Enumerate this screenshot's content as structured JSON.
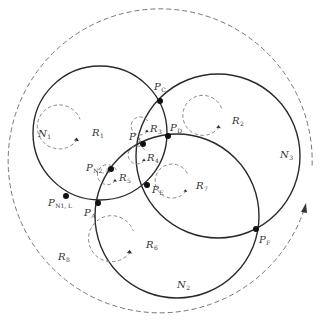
{
  "diagram": {
    "networks": [
      {
        "id": "N1",
        "label": "N",
        "sub": "1",
        "cx": 100,
        "cy": 133,
        "r": 67,
        "label_x": 38,
        "label_y": 137
      },
      {
        "id": "N2",
        "label": "N",
        "sub": "2",
        "cx": 177,
        "cy": 216,
        "r": 82,
        "label_x": 177,
        "label_y": 288
      },
      {
        "id": "N3",
        "label": "N",
        "sub": "3",
        "cx": 218,
        "cy": 156,
        "r": 82,
        "label_x": 280,
        "label_y": 158
      }
    ],
    "outer_region": {
      "cx": 163,
      "cy": 168,
      "r": 152,
      "label": "R",
      "sub": "8",
      "label_x": 58,
      "label_y": 260
    },
    "points": [
      {
        "id": "PA",
        "label": "P",
        "sub": "A",
        "x": 98,
        "y": 203,
        "label_x": 84,
        "label_y": 216
      },
      {
        "id": "PB",
        "label": "P",
        "sub": "B",
        "x": 143,
        "y": 144,
        "label_x": 129,
        "label_y": 140
      },
      {
        "id": "PC",
        "label": "P",
        "sub": "C",
        "x": 160,
        "y": 101,
        "label_x": 154,
        "label_y": 90
      },
      {
        "id": "PD",
        "label": "P",
        "sub": "D",
        "x": 168,
        "y": 136,
        "label_x": 170,
        "label_y": 131
      },
      {
        "id": "PE",
        "label": "P",
        "sub": "E",
        "x": 147,
        "y": 185,
        "label_x": 152,
        "label_y": 193
      },
      {
        "id": "PF",
        "label": "P",
        "sub": "F",
        "x": 256,
        "y": 229,
        "label_x": 259,
        "label_y": 243
      },
      {
        "id": "PN2L",
        "label": "P",
        "sub": "N2, L",
        "x": 111,
        "y": 169,
        "label_x": 86,
        "label_y": 171
      },
      {
        "id": "PN1L",
        "label": "P",
        "sub": "N1, L",
        "x": 66,
        "y": 196,
        "label_x": 48,
        "label_y": 206
      }
    ],
    "regions": [
      {
        "id": "R1",
        "label": "R",
        "sub": "1",
        "cx": 98,
        "cy": 132,
        "r": 22
      },
      {
        "id": "R2",
        "label": "R",
        "sub": "2",
        "cx": 238,
        "cy": 120,
        "r": 20
      },
      {
        "id": "R3",
        "label": "R",
        "sub": "3",
        "cx": 156,
        "cy": 128,
        "r": 9
      },
      {
        "id": "R4",
        "label": "R",
        "sub": "4",
        "cx": 153,
        "cy": 157,
        "r": 9
      },
      {
        "id": "R5",
        "label": "R",
        "sub": "5",
        "cx": 125,
        "cy": 177,
        "r": 10
      },
      {
        "id": "R6",
        "label": "R",
        "sub": "6",
        "cx": 152,
        "cy": 244,
        "r": 23
      },
      {
        "id": "R7",
        "label": "R",
        "sub": "7",
        "cx": 202,
        "cy": 185,
        "r": 17
      }
    ]
  }
}
